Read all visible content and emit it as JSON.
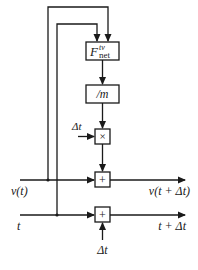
{
  "diagram": {
    "type": "block-diagram",
    "title": "",
    "colors": {
      "stroke": "#1a1a1a",
      "background": "#ffffff"
    },
    "blocks": [
      {
        "id": "fnet",
        "label_main": "F",
        "label_sup": "tv",
        "label_sub": "net"
      },
      {
        "id": "divm",
        "label": "/m"
      },
      {
        "id": "mult",
        "label": "×"
      },
      {
        "id": "add_v",
        "label": "+"
      },
      {
        "id": "add_t",
        "label": "+"
      }
    ],
    "inputs": {
      "v": "v(t)",
      "t": "t",
      "dt_mult": "Δt",
      "dt_add": "Δt"
    },
    "outputs": {
      "v_next": "v(t + Δt)",
      "t_next": "t + Δt"
    },
    "edges": [
      {
        "from": "v(t)",
        "to": "fnet"
      },
      {
        "from": "t",
        "to": "fnet"
      },
      {
        "from": "fnet",
        "to": "divm"
      },
      {
        "from": "divm",
        "to": "mult"
      },
      {
        "from": "Δt",
        "to": "mult"
      },
      {
        "from": "mult",
        "to": "add_v"
      },
      {
        "from": "v(t)",
        "to": "add_v"
      },
      {
        "from": "add_v",
        "to": "v(t + Δt)"
      },
      {
        "from": "t",
        "to": "add_t"
      },
      {
        "from": "Δt",
        "to": "add_t"
      },
      {
        "from": "add_t",
        "to": "t + Δt"
      }
    ]
  }
}
